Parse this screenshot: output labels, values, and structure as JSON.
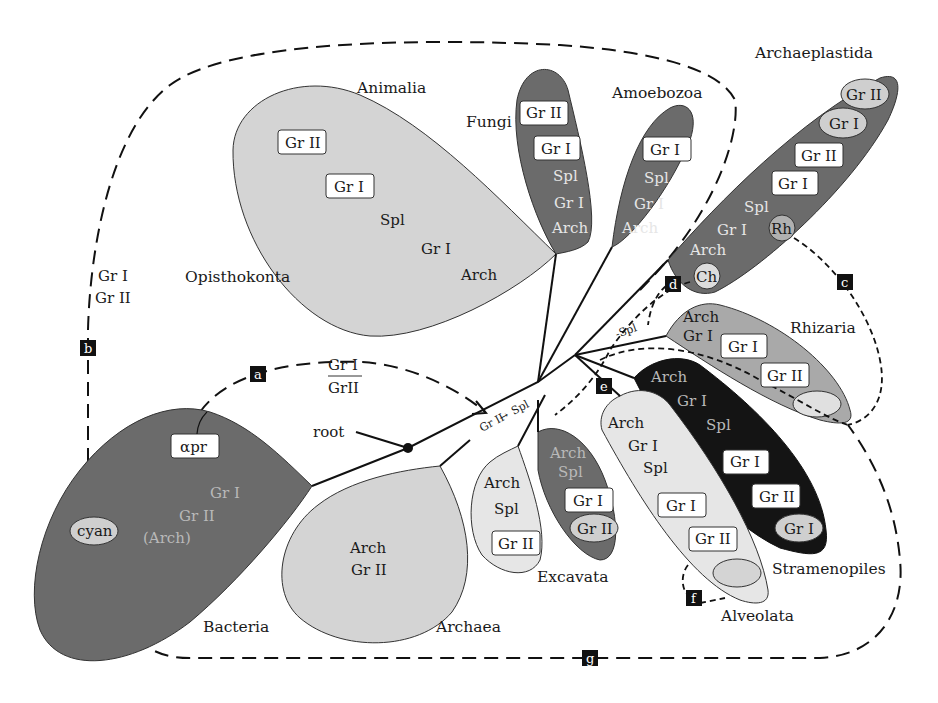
{
  "figure": {
    "type": "unrooted-phylogeny-intron-distribution",
    "legend_terms": [
      "Gr I",
      "Gr II",
      "Spl",
      "Arch",
      "αpr",
      "cyan",
      "Ch",
      "Rh"
    ]
  },
  "colors": {
    "dark_clade": "#6b6b6b",
    "mid_clade": "#a9a9a9",
    "light_clade": "#d4d4d4",
    "pale_clade": "#e6e6e6",
    "black_clade": "#141414",
    "label_box": "#ffffff",
    "oval": "#cfcfcf",
    "marker": "#111111"
  },
  "root": {
    "label": "root"
  },
  "clades": {
    "animalia": {
      "name": "Animalia",
      "boxes": [
        "Gr II",
        "Gr I"
      ],
      "texts": [
        "Spl",
        "Gr I",
        "Arch"
      ]
    },
    "opisthokonta": {
      "name": "Opisthokonta"
    },
    "fungi": {
      "name": "Fungi",
      "boxes": [
        "Gr II",
        "Gr I"
      ],
      "texts": [
        "Spl",
        "Gr I",
        "Arch"
      ]
    },
    "amoebozoa": {
      "name": "Amoebozoa",
      "boxes": [
        "Gr I"
      ],
      "texts": [
        "Spl",
        "Gr I",
        "Arch"
      ]
    },
    "archaeplastida": {
      "name": "Archaeplastida",
      "ovals": [
        "Gr II",
        "Gr I"
      ],
      "boxes": [
        "Gr II",
        "Gr I"
      ],
      "texts": [
        "Spl",
        "Gr I",
        "Arch"
      ],
      "organelles": [
        "Rh",
        "Ch"
      ]
    },
    "rhizaria": {
      "name": "Rhizaria",
      "texts": [
        "Arch",
        "Gr I"
      ],
      "boxes": [
        "Gr I",
        "Gr II"
      ]
    },
    "stramenopiles": {
      "name": "Stramenopiles",
      "texts": [
        "Arch",
        "Gr I",
        "Spl"
      ],
      "boxes": [
        "Gr I",
        "Gr II"
      ],
      "ovals": [
        "Gr I"
      ]
    },
    "alveolata": {
      "name": "Alveolata",
      "texts": [
        "Arch",
        "Gr I",
        "Spl"
      ],
      "boxes": [
        "Gr I",
        "Gr II"
      ]
    },
    "excavata": {
      "name": "Excavata",
      "left": {
        "texts": [
          "Arch",
          "Spl"
        ],
        "boxes": [
          "Gr II"
        ]
      },
      "right": {
        "texts": [
          "Arch",
          "Spl"
        ],
        "boxes": [
          "Gr I"
        ],
        "ovals": [
          "Gr II"
        ]
      }
    },
    "archaea": {
      "name": "Archaea",
      "texts": [
        "Arch",
        "Gr II"
      ]
    },
    "bacteria": {
      "name": "Bacteria",
      "boxes": [
        "αpr"
      ],
      "ovals": [
        "cyan"
      ],
      "texts": [
        "Gr I",
        "Gr II",
        "(Arch)"
      ]
    }
  },
  "transfers": {
    "a": {
      "label": "a",
      "text_top": "Gr I",
      "text_bottom": "GrII"
    },
    "b": {
      "label": "b",
      "text_top": "Gr I",
      "text_bottom": "Gr II"
    },
    "c": {
      "label": "c"
    },
    "d": {
      "label": "d",
      "text": "-Spl"
    },
    "e": {
      "label": "e"
    },
    "f": {
      "label": "f"
    },
    "g": {
      "label": "g"
    }
  },
  "stem_annotation": {
    "from": "Gr II",
    "arrow": "→",
    "to": "Spl"
  }
}
